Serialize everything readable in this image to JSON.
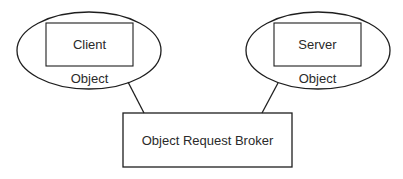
{
  "diagram": {
    "client": {
      "box_label": "Client",
      "container_label": "Object"
    },
    "server": {
      "box_label": "Server",
      "container_label": "Object"
    },
    "broker": {
      "label": "Object Request Broker"
    },
    "colors": {
      "stroke": "#1e1e1e",
      "text": "#2a2a2a",
      "background": "#ffffff"
    }
  }
}
